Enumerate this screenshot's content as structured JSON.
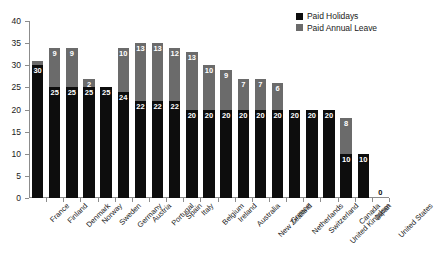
{
  "chart_data": {
    "type": "bar",
    "stacked": true,
    "title": "",
    "subtitle": "",
    "xlabel": "",
    "ylabel": "",
    "ylim": [
      0,
      40
    ],
    "yticks": [
      0,
      5,
      10,
      15,
      20,
      25,
      30,
      35,
      40
    ],
    "grid": false,
    "legend_position": "top-right",
    "categories": [
      "France",
      "Finland",
      "Denmark",
      "Norway",
      "Sweden",
      "Germany",
      "Austria",
      "Portugal",
      "Spain",
      "Italy",
      "Belgium",
      "Ireland",
      "Australia",
      "New Zealand",
      "Greece",
      "Netherlands",
      "Switzerland",
      "United Kingdom",
      "Canada",
      "Japan",
      "United States"
    ],
    "series": [
      {
        "name": "Paid Holidays",
        "color": "#0d0d0d",
        "values": [
          30,
          25,
          25,
          25,
          25,
          24,
          22,
          22,
          22,
          20,
          20,
          20,
          20,
          20,
          20,
          20,
          20,
          20,
          10,
          10,
          0
        ]
      },
      {
        "name": "Paid Annual Leave",
        "color": "#6b6b6b",
        "values": [
          1,
          9,
          9,
          2,
          0,
          10,
          13,
          13,
          12,
          13,
          10,
          9,
          7,
          7,
          6,
          0,
          0,
          0,
          8,
          0,
          0
        ]
      }
    ],
    "totals": [
      31,
      34,
      34,
      27,
      25,
      34,
      35,
      35,
      34,
      33,
      30,
      29,
      27,
      27,
      26,
      20,
      20,
      20,
      18,
      10,
      0
    ],
    "bar_labels": {
      "France": {
        "holidays": "30",
        "leave": ""
      },
      "Finland": {
        "holidays": "25",
        "leave": "9"
      },
      "Denmark": {
        "holidays": "25",
        "leave": "9"
      },
      "Norway": {
        "holidays": "25",
        "leave": "2"
      },
      "Sweden": {
        "holidays": "25",
        "leave": ""
      },
      "Germany": {
        "holidays": "24",
        "leave": "10"
      },
      "Austria": {
        "holidays": "22",
        "leave": "13"
      },
      "Portugal": {
        "holidays": "22",
        "leave": "13"
      },
      "Spain": {
        "holidays": "22",
        "leave": "12"
      },
      "Italy": {
        "holidays": "20",
        "leave": "13"
      },
      "Belgium": {
        "holidays": "20",
        "leave": "10"
      },
      "Ireland": {
        "holidays": "20",
        "leave": "9"
      },
      "Australia": {
        "holidays": "20",
        "leave": "7"
      },
      "New Zealand": {
        "holidays": "20",
        "leave": "7"
      },
      "Greece": {
        "holidays": "20",
        "leave": "6"
      },
      "Netherlands": {
        "holidays": "20",
        "leave": ""
      },
      "Switzerland": {
        "holidays": "20",
        "leave": ""
      },
      "United Kingdom": {
        "holidays": "20",
        "leave": ""
      },
      "Canada": {
        "holidays": "10",
        "leave": "8"
      },
      "Japan": {
        "holidays": "10",
        "leave": ""
      },
      "United States": {
        "holidays": "0",
        "leave": ""
      }
    }
  },
  "legend": {
    "entries": [
      {
        "label": "Paid Holidays",
        "color": "#0d0d0d",
        "swatch": "black-square-icon"
      },
      {
        "label": "Paid Annual Leave",
        "color": "#6b6b6b",
        "swatch": "gray-square-icon"
      }
    ]
  },
  "axis": {
    "y_tick_labels": [
      "40",
      "35",
      "30",
      "25",
      "20",
      "15",
      "10",
      "5",
      "0"
    ]
  }
}
